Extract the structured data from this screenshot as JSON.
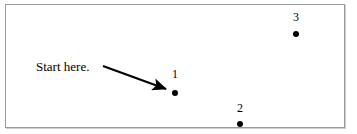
{
  "figure": {
    "background_color": "#ffffff",
    "border_color": "#9a9a9a",
    "shadow_color": "#cfcfcf",
    "width": 357,
    "height": 134
  },
  "annotation": {
    "start_label": "Start here.",
    "arrow": {
      "from_x": 103,
      "from_y": 66,
      "to_x": 169,
      "to_y": 90,
      "color": "#000000"
    }
  },
  "points": [
    {
      "label": "1",
      "x": 175,
      "y": 93,
      "label_x": 175,
      "label_y": 74,
      "color": "#000000"
    },
    {
      "label": "2",
      "x": 240,
      "y": 124,
      "label_x": 240,
      "label_y": 108,
      "color": "#000000"
    },
    {
      "label": "3",
      "x": 296,
      "y": 34,
      "label_x": 296,
      "label_y": 17,
      "color": "#000000"
    }
  ]
}
